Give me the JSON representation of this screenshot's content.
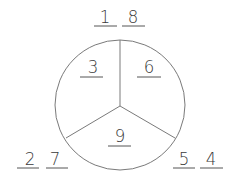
{
  "diagram": {
    "type": "number-bond-circle",
    "colors": {
      "stroke": "#7a7a7a",
      "text": "#3a3a3a",
      "background": "#ffffff"
    },
    "circle": {
      "sections": [
        {
          "position": "top-left",
          "value": "3"
        },
        {
          "position": "top-right",
          "value": "6"
        },
        {
          "position": "bottom",
          "value": "9"
        }
      ]
    },
    "outer": {
      "top": {
        "left": "1",
        "right": "8"
      },
      "bottom_left": {
        "left": "2",
        "right": "7"
      },
      "bottom_right": {
        "left": "5",
        "right": "4"
      }
    }
  }
}
